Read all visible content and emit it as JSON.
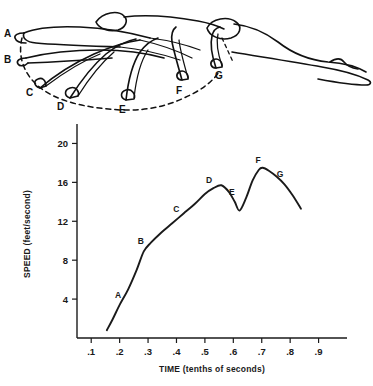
{
  "figure": {
    "caption_visible": false,
    "point_labels": [
      {
        "id": "A",
        "x": 10,
        "y": 34
      },
      {
        "id": "B",
        "x": 10,
        "y": 60
      },
      {
        "id": "C",
        "x": 32,
        "y": 92
      },
      {
        "id": "D",
        "x": 62,
        "y": 106
      },
      {
        "id": "E",
        "x": 124,
        "y": 110
      },
      {
        "id": "F",
        "x": 180,
        "y": 92
      },
      {
        "id": "G",
        "x": 218,
        "y": 76
      }
    ]
  },
  "chart_data": {
    "type": "line",
    "title": "",
    "xlabel": "TIME (tenths of seconds)",
    "ylabel": "SPEED (feet/second)",
    "xlim": [
      0.05,
      1.0
    ],
    "ylim": [
      0,
      22
    ],
    "xticks": [
      ".1",
      ".2",
      ".3",
      ".4",
      ".5",
      ".6",
      ".7",
      ".8",
      ".9"
    ],
    "xtick_values": [
      0.1,
      0.2,
      0.3,
      0.4,
      0.5,
      0.6,
      0.7,
      0.8,
      0.9
    ],
    "yticks": [
      "4",
      "8",
      "12",
      "16",
      "20"
    ],
    "ytick_values": [
      4,
      8,
      12,
      16,
      20
    ],
    "grid": false,
    "legend": "none",
    "series": [
      {
        "name": "hand speed",
        "x": [
          0.155,
          0.175,
          0.2,
          0.23,
          0.26,
          0.285,
          0.31,
          0.345,
          0.385,
          0.425,
          0.465,
          0.5,
          0.53,
          0.558,
          0.585,
          0.605,
          0.622,
          0.645,
          0.668,
          0.69,
          0.703,
          0.725,
          0.752,
          0.78,
          0.808,
          0.838
        ],
        "y": [
          0.8,
          1.9,
          3.4,
          5.0,
          7.0,
          8.9,
          9.8,
          10.8,
          11.8,
          12.8,
          13.8,
          14.8,
          15.4,
          15.7,
          15.0,
          14.0,
          13.1,
          14.4,
          16.2,
          17.3,
          17.5,
          17.2,
          16.6,
          15.8,
          14.7,
          13.3
        ]
      }
    ],
    "annotations": [
      {
        "label": "A",
        "x": 0.205,
        "y": 3.5
      },
      {
        "label": "B",
        "x": 0.285,
        "y": 9.0
      },
      {
        "label": "C",
        "x": 0.41,
        "y": 12.3
      },
      {
        "label": "D",
        "x": 0.525,
        "y": 15.3
      },
      {
        "label": "E",
        "x": 0.605,
        "y": 14.1
      },
      {
        "label": "F",
        "x": 0.698,
        "y": 17.4
      },
      {
        "label": "G",
        "x": 0.775,
        "y": 15.9
      }
    ]
  }
}
